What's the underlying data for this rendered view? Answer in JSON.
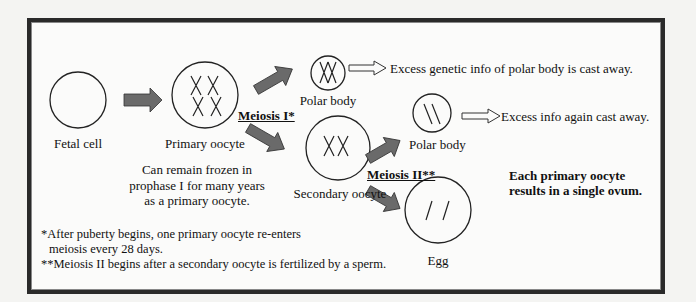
{
  "labels": {
    "fetal_cell": "Fetal cell",
    "primary_oocyte": "Primary oocyte",
    "meiosis_one": "Meiosis I*",
    "polar_body_1": "Polar body",
    "excess_1": "Excess genetic info of polar body is cast away.",
    "excess_2": "Excess info again cast away.",
    "polar_body_2": "Polar body",
    "secondary_oocyte": "Secondary oocyte",
    "meiosis_two": "Meiosis II**",
    "egg": "Egg"
  },
  "notes": {
    "frozen": [
      "Can remain frozen in",
      "prophase I for many years",
      "as a primary oocyte."
    ],
    "summary": [
      "Each primary oocyte",
      "results in a single ovum."
    ],
    "footnote_1": [
      "*After puberty begins, one primary oocyte re-enters",
      "meiosis every 28 days."
    ],
    "footnote_2": "**Meiosis II begins after a secondary oocyte is fertilized by a sperm."
  },
  "colors": {
    "arrow_fill": "#6a6a6a",
    "arrow_stroke": "#333333",
    "frame": "#2a2a2a"
  }
}
